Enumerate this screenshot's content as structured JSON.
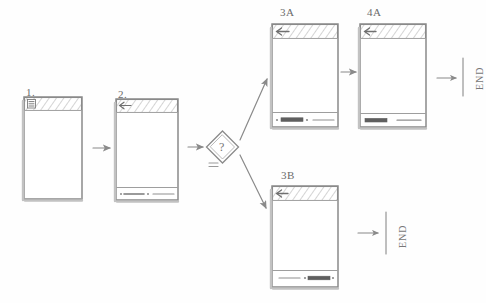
{
  "diagram": {
    "medium": "pencil sketch on white paper",
    "ink_color": "#8a8a8a",
    "paper_color": "#fefefe"
  },
  "screens": [
    {
      "id": "screen-1",
      "label": "1.",
      "label_x": 26,
      "label_y": 88,
      "x": 24,
      "y": 97,
      "w": 58,
      "h": 102,
      "header": {
        "type": "hatched-bar",
        "icon": "hamburger-menu-icon",
        "icon_side": "left"
      },
      "footer": null,
      "body_items": []
    },
    {
      "id": "screen-2",
      "label": "2.",
      "label_x": 118,
      "label_y": 90,
      "x": 116,
      "y": 99,
      "w": 62,
      "h": 101,
      "header": {
        "type": "hatched-bar",
        "icon": "back-arrow-icon",
        "icon_side": "left"
      },
      "footer": {
        "items": [
          "dot-with-line",
          "dot",
          "line"
        ]
      },
      "body_items": []
    },
    {
      "id": "screen-3a",
      "label": "3A",
      "label_x": 280,
      "label_y": 7,
      "x": 272,
      "y": 24,
      "w": 66,
      "h": 103,
      "header": {
        "type": "hatched-bar",
        "icon": "back-arrow-icon",
        "icon_side": "left"
      },
      "footer": {
        "items": [
          "dot",
          "filled-bar",
          "dot",
          "line"
        ]
      },
      "body_items": []
    },
    {
      "id": "screen-4a",
      "label": "4A",
      "label_x": 367,
      "label_y": 7,
      "x": 360,
      "y": 24,
      "w": 66,
      "h": 103,
      "header": {
        "type": "hatched-bar",
        "icon": "back-arrow-icon",
        "icon_side": "left"
      },
      "footer": {
        "items": [
          "filled-bar",
          "line"
        ]
      },
      "body_items": []
    },
    {
      "id": "screen-3b",
      "label": "3B",
      "label_x": 281,
      "label_y": 170,
      "x": 272,
      "y": 186,
      "w": 66,
      "h": 101,
      "header": {
        "type": "hatched-bar",
        "icon": "back-arrow-icon",
        "icon_side": "left"
      },
      "footer": {
        "items": [
          "line",
          "dot",
          "filled-bar",
          "dot"
        ]
      },
      "body_items": []
    }
  ],
  "decision": {
    "id": "decision-node",
    "glyph": "?",
    "shape": "diamond",
    "x": 207,
    "y": 131,
    "size": 31,
    "marks": "double-underline"
  },
  "terminators": [
    {
      "id": "end-top",
      "label": "END",
      "x": 470,
      "y": 88
    },
    {
      "id": "end-bottom",
      "label": "END",
      "x": 392,
      "y": 252
    }
  ],
  "connectors": [
    {
      "id": "arrow-1-to-2",
      "from": "screen-1",
      "to": "screen-2",
      "kind": "straight-right"
    },
    {
      "id": "arrow-2-to-decision",
      "from": "screen-2",
      "to": "decision-node",
      "kind": "straight-right"
    },
    {
      "id": "arrow-decision-to-3a",
      "from": "decision-node",
      "to": "screen-3a",
      "kind": "diagonal-up-right"
    },
    {
      "id": "arrow-decision-to-3b",
      "from": "decision-node",
      "to": "screen-3b",
      "kind": "diagonal-down-right"
    },
    {
      "id": "arrow-3a-to-4a",
      "from": "screen-3a",
      "to": "screen-4a",
      "kind": "straight-right"
    },
    {
      "id": "arrow-4a-to-end",
      "from": "screen-4a",
      "to": "end-top",
      "kind": "straight-right"
    },
    {
      "id": "arrow-3b-to-end",
      "from": "screen-3b",
      "to": "end-bottom",
      "kind": "straight-right"
    }
  ]
}
